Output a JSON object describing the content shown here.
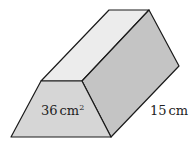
{
  "figure": {
    "type": "trapezoidal-prism",
    "colors": {
      "front_face": "#d6d6d6",
      "top_face": "#ececec",
      "side_face": "#c4c4c4",
      "edge": "#1a1a1a"
    },
    "labels": {
      "area_value": "36",
      "area_unit": "cm",
      "area_exponent": "2",
      "length_value": "15",
      "length_unit": "cm"
    }
  }
}
